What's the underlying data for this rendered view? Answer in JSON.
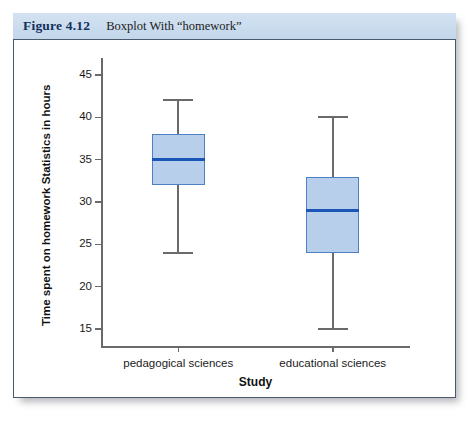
{
  "caption": {
    "number": "Figure 4.12",
    "text": "Boxplot With “homework”"
  },
  "colors": {
    "band": "#cadcee",
    "caption_number": "#14305c",
    "box_fill": "#b8cfec",
    "box_border": "#4f7fc4",
    "median": "#1b55b8",
    "axis": "#6a6a6a",
    "panel_border": "#4a5a6a"
  },
  "chart_data": {
    "type": "boxplot",
    "title": "Boxplot With “homework”",
    "xlabel": "Study",
    "ylabel": "Time spent on homework Statistics in hours",
    "ylim": [
      13,
      47
    ],
    "yticks": [
      15,
      20,
      25,
      30,
      35,
      40,
      45
    ],
    "ytick_labels": [
      "15",
      "20",
      "25",
      "30",
      "35",
      "40",
      "45"
    ],
    "grid": false,
    "legend": "none",
    "categories": [
      "pedagogical sciences",
      "educational sciences"
    ],
    "boxes": [
      {
        "category": "pedagogical sciences",
        "whisker_low": 24,
        "q1": 32,
        "median": 35,
        "q3": 38,
        "whisker_high": 42
      },
      {
        "category": "educational sciences",
        "whisker_low": 15,
        "q1": 24,
        "median": 29,
        "q3": 33,
        "whisker_high": 40
      }
    ]
  }
}
